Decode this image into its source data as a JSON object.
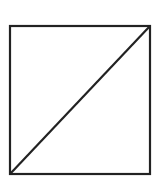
{
  "diagram": {
    "canvas": {
      "width": 155,
      "height": 184,
      "background": "#ffffff"
    },
    "square": {
      "x": 10,
      "y": 26,
      "width": 140,
      "height": 148,
      "stroke": "#222222",
      "stroke_width": 2.2
    },
    "diagonal": {
      "x1": 10,
      "y1": 174,
      "x2": 150,
      "y2": 26,
      "stroke": "#222222",
      "stroke_width": 2.2
    }
  }
}
